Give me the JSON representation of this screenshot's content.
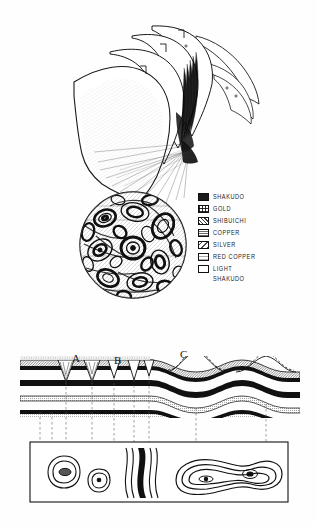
{
  "figure": {
    "ink_color": "#111111",
    "paper_color": "#fefefe"
  },
  "legend": {
    "name": "metal-key",
    "items": [
      {
        "label": "SHAKUDO",
        "pattern": "solid-black",
        "color": "#1a1a1a"
      },
      {
        "label": "GOLD",
        "pattern": "cross-grid",
        "color": "#4a4a4a"
      },
      {
        "label": "SHIBUICHI",
        "pattern": "dense-dots",
        "color": "#6a6a6a"
      },
      {
        "label": "COPPER",
        "pattern": "fine-stipple",
        "color": "#8a8a8a"
      },
      {
        "label": "SILVER",
        "pattern": "diagonal-hatch",
        "color": "#9a9a9a"
      },
      {
        "label": "RED COPPER",
        "pattern": "light-hatch",
        "color": "#b5b5b5"
      },
      {
        "label": "LIGHT\nSHAKUDO",
        "pattern": "blank",
        "color": "#ffffff"
      }
    ]
  },
  "annotations": {
    "a": "A",
    "b": "B",
    "c": "C"
  },
  "panels": {
    "stack": "fanned sheet stack",
    "disc": "circular mokume pattern disc",
    "section": "layered cross-section",
    "plan": "plan view contour panel"
  }
}
